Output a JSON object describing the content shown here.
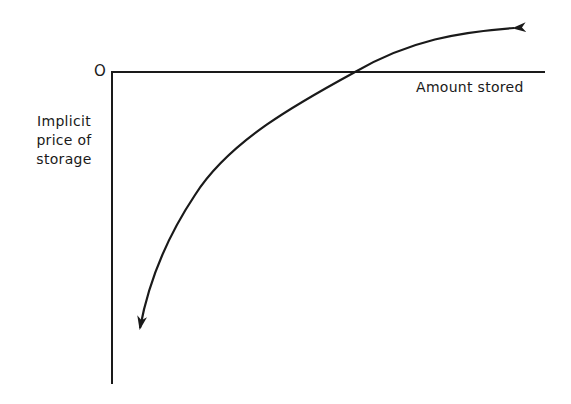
{
  "figure": {
    "origin_label": "O",
    "x_axis_label": "Amount stored",
    "y_axis_label_lines": [
      "Implicit",
      "price of",
      "storage"
    ],
    "colors": {
      "ink": "#1a1a1a",
      "background": "#ffffff"
    },
    "curve": {
      "description": "Concave increasing curve of implicit price of storage vs amount stored; negative for small amounts, crossing zero, rising toward positive; arrowheads at both ends",
      "arrowheads": [
        "start",
        "end"
      ]
    }
  }
}
